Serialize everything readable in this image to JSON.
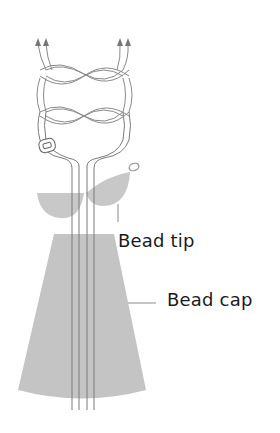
{
  "diagram": {
    "labels": {
      "bead_tip": "Bead tip",
      "bead_cap": "Bead cap"
    },
    "colors": {
      "cord": "#8a8a8a",
      "fill": "#c4c4c4",
      "text": "#1a1a1a",
      "background": "#ffffff"
    },
    "parts": [
      "arrows",
      "square-knots",
      "cord-loop",
      "clasp",
      "cord-stem",
      "bead-tip",
      "bead-cap"
    ]
  }
}
